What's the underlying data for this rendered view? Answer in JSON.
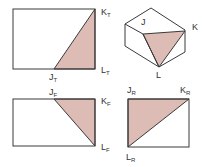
{
  "colors": {
    "shade": "#dcbcb4",
    "line": "#3a3a3a",
    "text": "#333333",
    "background": "#ffffff"
  },
  "views": {
    "top": {
      "name": "top-view",
      "labels": {
        "K": {
          "main": "K",
          "sub": "T"
        },
        "L": {
          "main": "L",
          "sub": "T"
        },
        "J": {
          "main": "J",
          "sub": "T"
        }
      }
    },
    "isometric": {
      "name": "isometric-view",
      "labels": {
        "J": {
          "main": "J"
        },
        "K": {
          "main": "K"
        },
        "L": {
          "main": "L"
        }
      }
    },
    "front": {
      "name": "front-view",
      "labels": {
        "J": {
          "main": "J",
          "sub": "F"
        },
        "K": {
          "main": "K",
          "sub": "F"
        },
        "L": {
          "main": "L",
          "sub": "F"
        }
      }
    },
    "right": {
      "name": "right-side-view",
      "labels": {
        "J": {
          "main": "J",
          "sub": "R"
        },
        "K": {
          "main": "K",
          "sub": "R"
        },
        "L": {
          "main": "L",
          "sub": "R"
        }
      }
    }
  }
}
